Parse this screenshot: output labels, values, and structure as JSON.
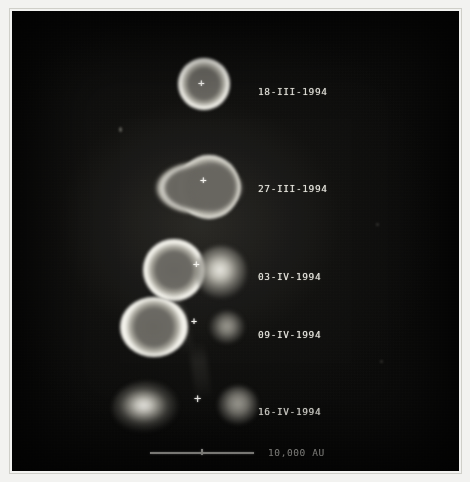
{
  "figure": {
    "kind": "astronomical-plate-montage",
    "background_color": "#070706",
    "paper_color": "#f2f2f0",
    "frame_color": "#cfcfc9",
    "label_color": "#e8e7e0"
  },
  "rows": [
    {
      "id": "row-1",
      "date_label": "18-III-1994",
      "label_x": 256,
      "label_y": 80,
      "marker": "+",
      "marker_x": 199,
      "marker_y": 84
    },
    {
      "id": "row-2",
      "date_label": "27-III-1994",
      "label_x": 256,
      "label_y": 177,
      "marker": "+",
      "marker_x": 201,
      "marker_y": 180
    },
    {
      "id": "row-3",
      "date_label": "03-IV-1994",
      "label_x": 256,
      "label_y": 265,
      "marker": "+",
      "marker_x": 194,
      "marker_y": 264
    },
    {
      "id": "row-4",
      "date_label": "09-IV-1994",
      "label_x": 256,
      "label_y": 323,
      "marker": "+",
      "marker_x": 192,
      "marker_y": 322
    },
    {
      "id": "row-5",
      "date_label": "16-IV-1994",
      "label_x": 256,
      "label_y": 400,
      "marker": "+",
      "marker_x": 196,
      "marker_y": 399
    }
  ],
  "scalebar": {
    "label": "10,000 AU",
    "bar_x": 150,
    "bar_y": 452,
    "bar_width": 104,
    "tick_offset": 52,
    "label_x": 268,
    "label_y": 448
  },
  "objects": [
    {
      "id": "obj-r1-ring",
      "type": "ring",
      "x": 178,
      "y": 60,
      "w": 46,
      "h": 46
    },
    {
      "id": "obj-r2-ring",
      "type": "ring-elongated",
      "x": 152,
      "y": 153,
      "w": 90,
      "h": 60
    },
    {
      "id": "obj-r3-ring",
      "type": "ring",
      "x": 143,
      "y": 240,
      "w": 52,
      "h": 52
    },
    {
      "id": "obj-r3-blob",
      "type": "blob",
      "x": 196,
      "y": 248,
      "w": 38,
      "h": 38,
      "brightness": "bright"
    },
    {
      "id": "obj-r4-ring",
      "type": "ring",
      "x": 120,
      "y": 298,
      "w": 56,
      "h": 50
    },
    {
      "id": "obj-r4-blob",
      "type": "blob",
      "x": 206,
      "y": 310,
      "w": 24,
      "h": 24,
      "brightness": "dim"
    },
    {
      "id": "obj-r5-blob-left",
      "type": "blob",
      "x": 114,
      "y": 382,
      "w": 52,
      "h": 40,
      "brightness": "bright"
    },
    {
      "id": "obj-r5-blob-right",
      "type": "blob",
      "x": 220,
      "y": 386,
      "w": 28,
      "h": 28,
      "brightness": "dim"
    }
  ]
}
